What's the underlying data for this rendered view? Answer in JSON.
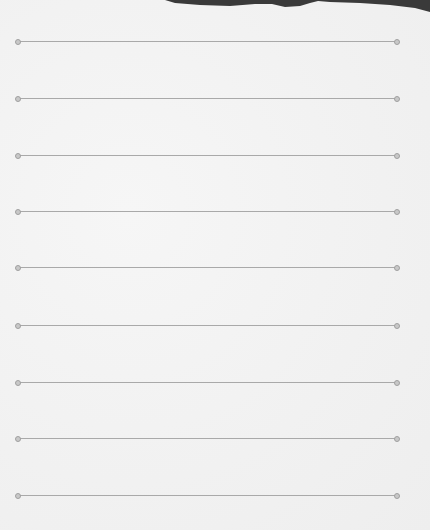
{
  "scene": {
    "description": "Photo of a blank lined sheet of paper",
    "paper_color": "#f3f3f3",
    "line_color": "#a9a9a9",
    "background_shape_color": "#3a3a3a"
  },
  "lines": [
    {
      "y": 41
    },
    {
      "y": 98
    },
    {
      "y": 155
    },
    {
      "y": 211
    },
    {
      "y": 267
    },
    {
      "y": 325
    },
    {
      "y": 382
    },
    {
      "y": 438
    },
    {
      "y": 495
    }
  ]
}
